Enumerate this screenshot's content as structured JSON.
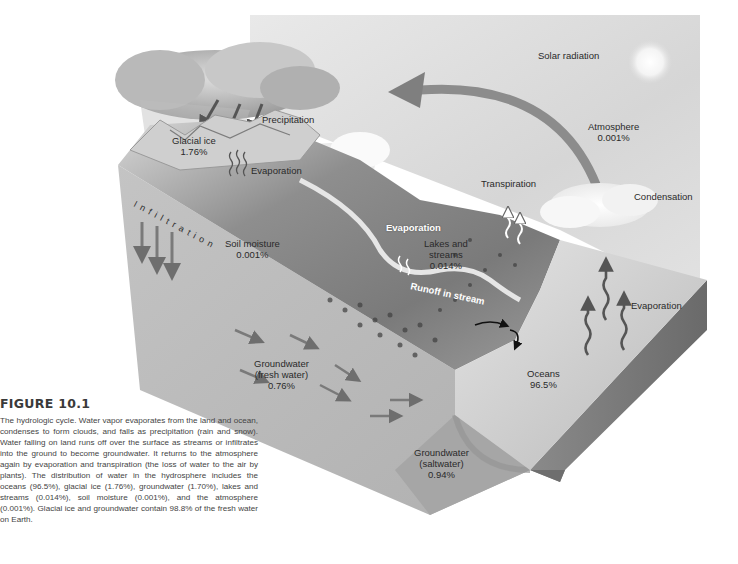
{
  "figure": {
    "number": "FIGURE 10.1",
    "caption": "The hydrologic cycle. Water vapor evaporates from the land and ocean, condenses to form clouds, and falls as precipitation (rain and snow). Water falling on land runs off over the surface as streams or infiltrates into the ground to become groundwater. It returns to the atmosphere again by evaporation and transpiration (the loss of water to the air by plants). The distribution of water in the hydrosphere includes the oceans (96.5%), glacial ice (1.76%), groundwater (1.70%), lakes and streams (0.014%), soil moisture (0.001%), and the atmosphere (0.001%). Glacial ice and groundwater contain 98.8% of the fresh water on Earth."
  },
  "labels": {
    "solar_radiation": "Solar radiation",
    "precipitation": "Precipitation",
    "glacial_ice": {
      "name": "Glacial ice",
      "value": "1.76%"
    },
    "evaporation_glacier": "Evaporation",
    "atmosphere": {
      "name": "Atmosphere",
      "value": "0.001%"
    },
    "transpiration": "Transpiration",
    "condensation": "Condensation",
    "infiltration": "Infiltration",
    "soil_moisture": {
      "name": "Soil moisture",
      "value": "0.001%"
    },
    "evaporation_lake": "Evaporation",
    "lakes_streams": {
      "name_line1": "Lakes and",
      "name_line2": "streams",
      "value": "0.014%"
    },
    "runoff": "Runoff in stream",
    "evaporation_ocean": "Evaporation",
    "groundwater_fresh": {
      "name_line1": "Groundwater",
      "name_line2": "(fresh water)",
      "value": "0.76%"
    },
    "oceans": {
      "name": "Oceans",
      "value": "96.5%"
    },
    "groundwater_salt": {
      "name_line1": "Groundwater",
      "name_line2": "(saltwater)",
      "value": "0.94%"
    }
  },
  "colors": {
    "sky": "#d9d9d9",
    "arrow": "#6e6e6e",
    "ground_face": "#b8b8b8",
    "saltwater_face": "#a3a3a3",
    "ocean_top": "#c9c9c9"
  }
}
